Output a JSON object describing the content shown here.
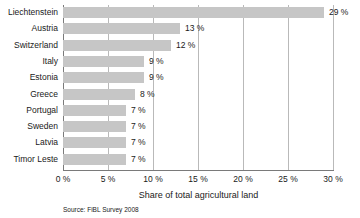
{
  "chart_data": {
    "type": "bar",
    "orientation": "horizontal",
    "title": "",
    "xlabel": "Share of total agricultural land",
    "ylabel": "",
    "xlim": [
      0,
      30
    ],
    "xticks": [
      "0 %",
      "5 %",
      "10 %",
      "15 %",
      "20 %",
      "25 %",
      "30 %"
    ],
    "xtick_values": [
      0,
      5,
      10,
      15,
      20,
      25,
      30
    ],
    "grid": "vertical",
    "legend": "none",
    "categories": [
      "Liechtenstein",
      "Austria",
      "Switzerland",
      "Italy",
      "Estonia",
      "Greece",
      "Portugal",
      "Sweden",
      "Latvia",
      "Timor Leste"
    ],
    "values": [
      29,
      13,
      12,
      9,
      9,
      8,
      7,
      7,
      7,
      7
    ],
    "value_labels": [
      "29 %",
      "13 %",
      "12 %",
      "9 %",
      "9 %",
      "8 %",
      "7 %",
      "7 %",
      "7 %",
      "7 %"
    ],
    "bar_color": "#c6c6c6",
    "gridline_color": "#b9b9b9",
    "axis_color": "#7a7a7a",
    "text_color": "#1a1a1a"
  },
  "footer": {
    "source": "Source: FiBL Survey 2008"
  }
}
